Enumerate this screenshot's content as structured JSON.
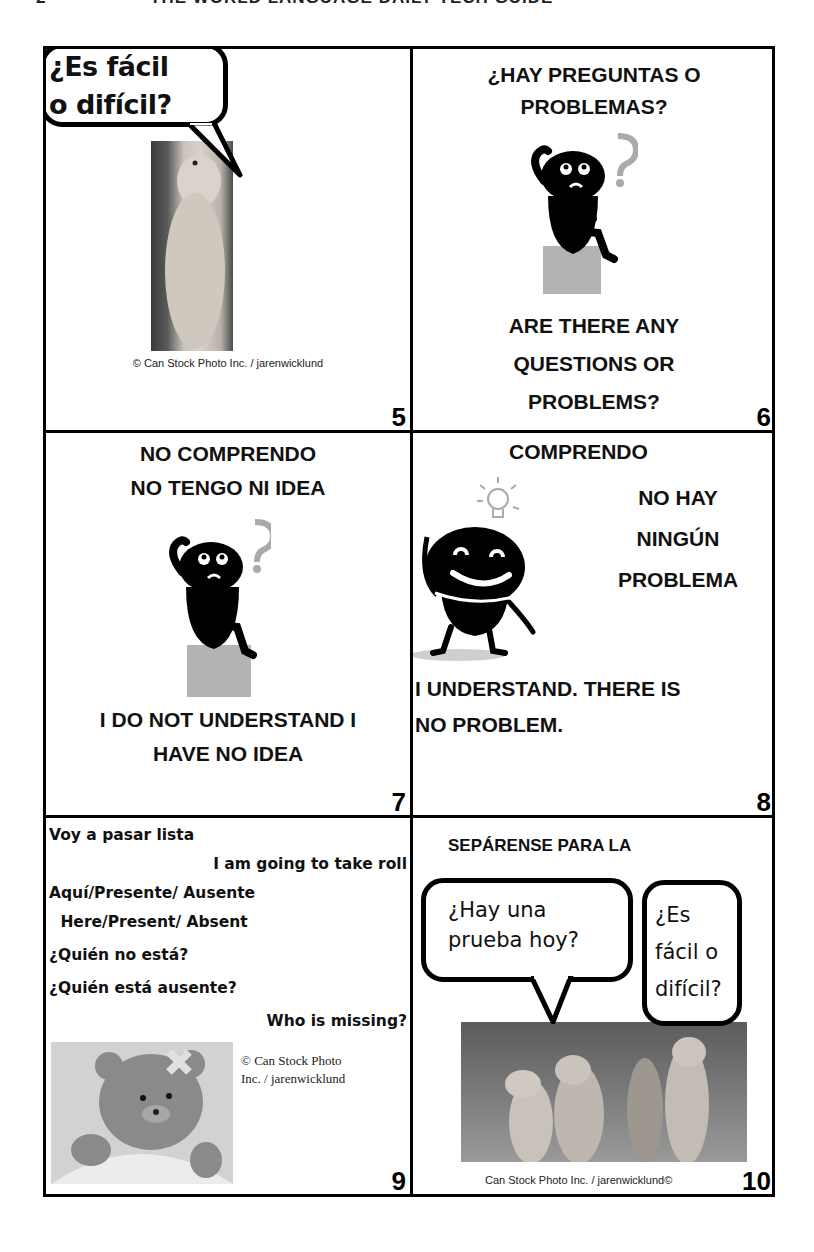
{
  "header": {
    "page_number": "2",
    "title": "THE WORLD LANGUAGE DAILY TECH GUIDE"
  },
  "cards": [
    {
      "number": "5",
      "bubble_text": [
        "¿Es fácil",
        "o difícil?"
      ],
      "image": "prairie-dog-standing-photo",
      "credit": "© Can Stock Photo Inc. / jarenwicklund"
    },
    {
      "number": "6",
      "spanish": [
        "¿HAY PREGUNTAS O",
        "PROBLEMAS?"
      ],
      "image": "thinking-figure-with-question-mark",
      "english": [
        "ARE THERE ANY",
        "QUESTIONS OR",
        "PROBLEMS?"
      ]
    },
    {
      "number": "7",
      "spanish": [
        "NO COMPRENDO",
        "NO TENGO NI IDEA"
      ],
      "image": "thinking-figure-with-question-mark",
      "english": [
        "I DO NOT UNDERSTAND I",
        "HAVE NO IDEA"
      ]
    },
    {
      "number": "8",
      "spanish_top": "COMPRENDO",
      "spanish_right": [
        "NO HAY",
        "NINGÚN",
        "PROBLEMA"
      ],
      "image": "happy-figure-with-lightbulb",
      "english": [
        "I UNDERSTAND. THERE IS",
        "NO PROBLEM."
      ]
    },
    {
      "number": "9",
      "lines": [
        {
          "text": "Voy a pasar lista",
          "align": "left"
        },
        {
          "text": "I am going to take roll",
          "align": "right"
        },
        {
          "text": "Aquí/Presente/ Ausente",
          "align": "left"
        },
        {
          "text": " Here/Present/ Absent",
          "align": "left"
        },
        {
          "text": "¿Quién no está?",
          "align": "left"
        },
        {
          "text": "¿Quién está ausente?",
          "align": "left"
        },
        {
          "text": "Who is missing?",
          "align": "right"
        }
      ],
      "image": "bandaged-teddy-bear-photo",
      "credit": [
        "© Can Stock Photo",
        "Inc. / jarenwicklund"
      ]
    },
    {
      "number": "10",
      "heading": "SEPÁRENSE PARA LA",
      "bubble_left": [
        "¿Hay una",
        "prueba hoy?"
      ],
      "bubble_right": [
        "¿Es",
        "fácil o",
        "difícil?"
      ],
      "image": "four-prairie-dogs-photo",
      "credit": "Can Stock Photo Inc. / jarenwicklund©"
    }
  ]
}
